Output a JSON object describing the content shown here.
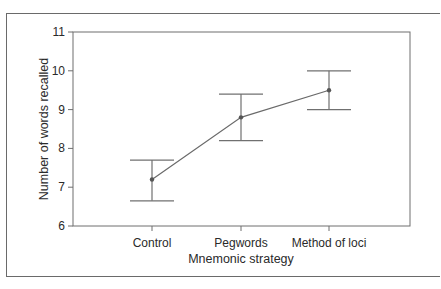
{
  "chart_data": {
    "type": "line",
    "title": "",
    "xlabel": "Mnemonic strategy",
    "ylabel": "Number of words recalled",
    "categories": [
      "Control",
      "Pegwords",
      "Method of loci"
    ],
    "series": [
      {
        "name": "Mean words recalled",
        "values": [
          7.2,
          8.8,
          9.5
        ],
        "error_upper": [
          7.7,
          9.4,
          10.0
        ],
        "error_lower": [
          6.65,
          8.2,
          9.0
        ]
      }
    ],
    "ylim": [
      6,
      11
    ],
    "yticks": [
      6,
      7,
      8,
      9,
      10,
      11
    ],
    "grid": false,
    "legend": "none"
  }
}
